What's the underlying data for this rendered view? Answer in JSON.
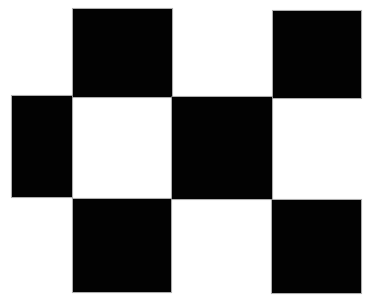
{
  "figure": {
    "background": "#ffffff",
    "fill": "#020202",
    "squares": [
      {
        "id": "top-left",
        "x": 73,
        "y": 9,
        "w": 99,
        "h": 88
      },
      {
        "id": "top-right",
        "x": 273,
        "y": 11,
        "w": 88,
        "h": 87
      },
      {
        "id": "middle-left",
        "x": 12,
        "y": 96,
        "w": 60,
        "h": 101
      },
      {
        "id": "middle-center",
        "x": 172,
        "y": 97,
        "w": 100,
        "h": 102
      },
      {
        "id": "bottom-left",
        "x": 73,
        "y": 199,
        "w": 98,
        "h": 93
      },
      {
        "id": "bottom-right",
        "x": 272,
        "y": 200,
        "w": 89,
        "h": 93
      }
    ]
  }
}
